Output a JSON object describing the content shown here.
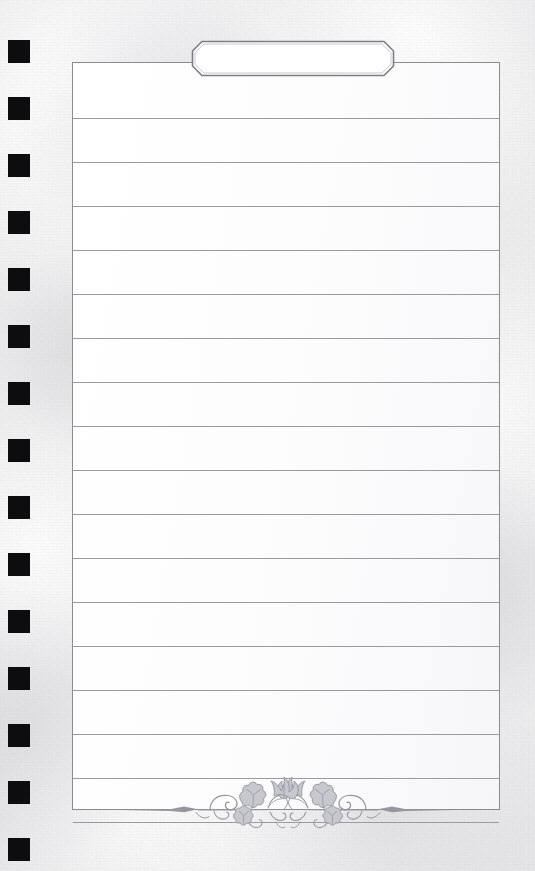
{
  "document": {
    "kind": "lined-notepad-page",
    "title_tab": {
      "label": "",
      "placeholder": "",
      "shape": "chamfered-octagon",
      "fill_color": "#ffffff",
      "border_color": "#7c7c86"
    },
    "sheet": {
      "fill_color": "#ffffff",
      "border_color": "#8b8b93",
      "rule_color": "#9a9aa2",
      "rule_count": 17,
      "rule_spacing_px": 44,
      "first_rule_y_px": 55,
      "lines": [
        {
          "index": 1,
          "text": ""
        },
        {
          "index": 2,
          "text": ""
        },
        {
          "index": 3,
          "text": ""
        },
        {
          "index": 4,
          "text": ""
        },
        {
          "index": 5,
          "text": ""
        },
        {
          "index": 6,
          "text": ""
        },
        {
          "index": 7,
          "text": ""
        },
        {
          "index": 8,
          "text": ""
        },
        {
          "index": 9,
          "text": ""
        },
        {
          "index": 10,
          "text": ""
        },
        {
          "index": 11,
          "text": ""
        },
        {
          "index": 12,
          "text": ""
        },
        {
          "index": 13,
          "text": ""
        },
        {
          "index": 14,
          "text": ""
        },
        {
          "index": 15,
          "text": ""
        },
        {
          "index": 16,
          "text": ""
        },
        {
          "index": 17,
          "text": ""
        }
      ]
    },
    "margin_marks": {
      "name": "punch-square",
      "color": "#0d0d0f",
      "count": 15,
      "size_px": 22,
      "spacing_px": 57,
      "first_y_px": 40,
      "left_x_px": 8
    },
    "ornament": {
      "name": "ivy-vine-flourish",
      "motif": "ivy leaves with scrolling tendrils and diamond finials",
      "color": "#9596a0",
      "symmetry": "horizontal-mirror"
    },
    "background": {
      "name": "textured-paper",
      "base_color": "#ececed",
      "mottle_light": "#ffffff",
      "mottle_dark": "#c4c4ca",
      "vignette_color": "#828290"
    }
  }
}
